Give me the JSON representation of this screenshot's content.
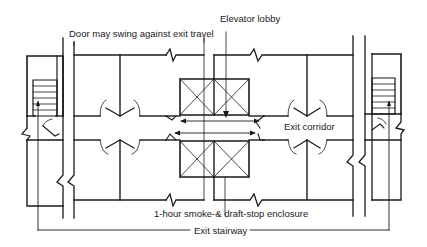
{
  "diagram": {
    "type": "floor-plan",
    "labels": {
      "door_swing": "Door may swing against exit travel",
      "elevator_lobby": "Elevator lobby",
      "exit_corridor": "Exit corridor",
      "enclosure": "1-hour smoke-& draft-stop enclosure",
      "exit_stairway": "Exit stairway"
    },
    "elements": {
      "left_stair": "Exit stairway (left)",
      "right_stair": "Exit stairway (right)",
      "corridor": "Exit corridor",
      "elevators_top": "Elevator shafts (upper pair)",
      "elevators_bottom": "Elevator shafts (lower pair)"
    },
    "colors": {
      "line": "#1a1a1a",
      "background": "#ffffff"
    }
  }
}
